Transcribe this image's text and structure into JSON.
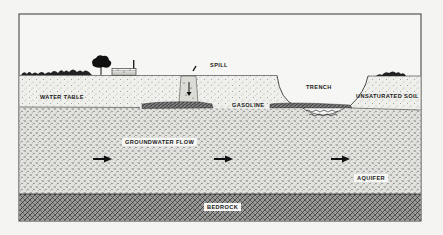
{
  "diagram": {
    "labels": {
      "spill": "SPILL",
      "trench": "TRENCH",
      "unsaturated_soil": "UNSATURATED SOIL",
      "water_table": "WATER TABLE",
      "gasoline": "GASOLINE",
      "groundwater_flow": "GROUNDWATER FLOW",
      "aquifer": "AQUIFER",
      "bedrock": "BEDROCK"
    },
    "colors": {
      "background": "#f4f4f2",
      "ink": "#1a1a1a",
      "soil_fill": "#ecece8",
      "aquifer_fill": "#d9d9d4",
      "bedrock_fill": "#5a5a5a"
    },
    "flow_arrows": 3
  }
}
